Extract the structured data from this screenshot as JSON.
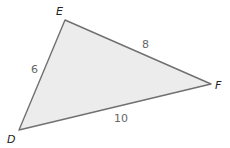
{
  "diagram": {
    "type": "triangle",
    "fill_color": "#ececec",
    "stroke_color": "#707070",
    "vertices": [
      {
        "label": "E",
        "x": 65,
        "y": 20,
        "label_x": 61,
        "label_y": 15
      },
      {
        "label": "F",
        "x": 211,
        "y": 84,
        "label_x": 215,
        "label_y": 89
      },
      {
        "label": "D",
        "x": 19,
        "y": 130,
        "label_x": 8,
        "label_y": 143
      }
    ],
    "sides": [
      {
        "between": "DE",
        "length": "6",
        "label_x": 35,
        "label_y": 73
      },
      {
        "between": "EF",
        "length": "8",
        "label_x": 146,
        "label_y": 48
      },
      {
        "between": "DF",
        "length": "10",
        "label_x": 120,
        "label_y": 122
      }
    ]
  }
}
